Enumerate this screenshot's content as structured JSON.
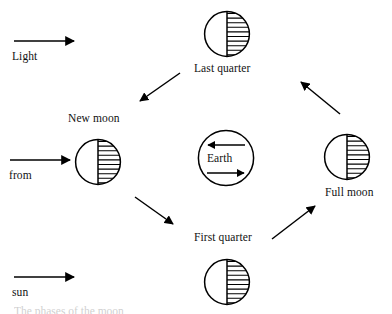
{
  "figure": {
    "type": "lunar-phase-diagram",
    "background_color": "#ffffff",
    "stroke_color": "#000000",
    "text_color": "#111111",
    "width": 392,
    "height": 314
  },
  "light_arrows": [
    {
      "id": "light",
      "label": "Light",
      "x": 14,
      "y": 41,
      "length": 62,
      "direction": "right",
      "label_x": 12,
      "label_y": 50
    },
    {
      "id": "from",
      "label": "from",
      "x": 10,
      "y": 160,
      "length": 62,
      "direction": "right",
      "label_x": 9,
      "label_y": 169
    },
    {
      "id": "sun",
      "label": "sun",
      "x": 14,
      "y": 277,
      "length": 62,
      "direction": "right",
      "label_x": 12,
      "label_y": 286
    }
  ],
  "moons": [
    {
      "id": "last-quarter",
      "label": "Last quarter",
      "cx": 227,
      "cy": 34,
      "r": 23,
      "lit_side": "left",
      "hatched_side": "right",
      "label_x": 194,
      "label_y": 62
    },
    {
      "id": "new-moon",
      "label": "New moon",
      "cx": 98,
      "cy": 162,
      "r": 23,
      "lit_side": "left",
      "hatched_side": "right",
      "label_x": 68,
      "label_y": 112
    },
    {
      "id": "full-moon",
      "label": "Full moon",
      "cx": 347,
      "cy": 157,
      "r": 23,
      "lit_side": "left",
      "hatched_side": "right",
      "label_x": 325,
      "label_y": 186
    },
    {
      "id": "first-quarter",
      "label": "First quarter",
      "cx": 227,
      "cy": 282,
      "r": 23,
      "lit_side": "left",
      "hatched_side": "right",
      "label_x": 194,
      "label_y": 231
    }
  ],
  "earth": {
    "label": "Earth",
    "cx": 226,
    "cy": 158,
    "r": 28,
    "top_arrow_direction": "left",
    "bottom_arrow_direction": "right",
    "label_x": 207,
    "label_y": 153
  },
  "orbit_arrows": [
    {
      "id": "orbit-upper-left",
      "x1": 180,
      "y1": 73,
      "x2": 139,
      "y2": 102,
      "direction": "down-left"
    },
    {
      "id": "orbit-lower-left",
      "x1": 135,
      "y1": 197,
      "x2": 174,
      "y2": 225,
      "direction": "down-right"
    },
    {
      "id": "orbit-lower-right",
      "x1": 272,
      "y1": 239,
      "x2": 316,
      "y2": 205,
      "direction": "up-right"
    },
    {
      "id": "orbit-upper-right",
      "x1": 340,
      "y1": 114,
      "x2": 300,
      "y2": 81,
      "direction": "up-left"
    }
  ],
  "caption_fragment": {
    "text": "The phases of the moon",
    "x": 14,
    "y": 305
  },
  "hatching": {
    "line_count": 9,
    "line_spacing_px": 4.6,
    "stroke_width": 1.1
  }
}
